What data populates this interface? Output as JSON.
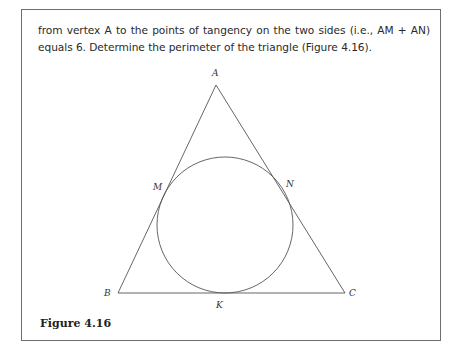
{
  "text": {
    "paragraph": "from vertex A to the points of tangency on the two sides (i.e., AM + AN) equals 6. Determine the perimeter of the triangle (Figure 4.16)."
  },
  "figure": {
    "caption": "Figure 4.16",
    "labels": {
      "A": "A",
      "B": "B",
      "C": "C",
      "M": "M",
      "N": "N",
      "K": "K"
    },
    "colors": {
      "stroke": "#555555",
      "border": "#6e6e6e"
    }
  }
}
